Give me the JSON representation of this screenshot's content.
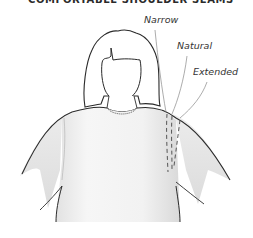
{
  "title": "COMFORTABLE SHOULDER SEAMS",
  "labels": {
    "narrow": "Narrow",
    "natural": "Natural",
    "extended": "Extended"
  },
  "colors": {
    "line": "#2a2a2a",
    "shading": "#d8d8d8",
    "dash": "#555555",
    "leader": "#888888"
  }
}
